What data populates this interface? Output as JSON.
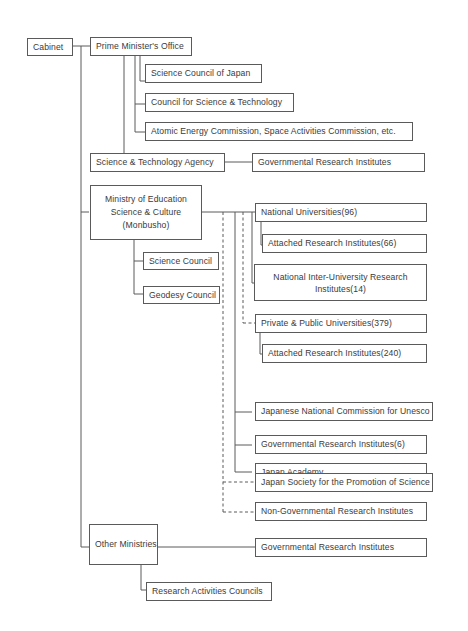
{
  "diagram": {
    "title": "",
    "colors": {
      "line": "#5a5a5a",
      "text": "#3a3a3a",
      "background": "#ffffff"
    },
    "nodes": {
      "cabinet": "Cabinet",
      "prime_ministers_office": "Prime Minister's Office",
      "science_council_of_japan": "Science Council of Japan",
      "council_for_science_technology": "Council for Science & Technology",
      "atomic_energy_commission": "Atomic Energy Commission, Space Activities Commission, etc.",
      "science_technology_agency": "Science & Technology Agency",
      "sta_governmental_research_institutes": "Governmental  Research Institutes",
      "monbusho_line1": "Ministry of Education",
      "monbusho_line2": "Science & Culture",
      "monbusho_line3": "(Monbusho)",
      "science_council": "Science Council",
      "geodesy_council": "Geodesy Council",
      "national_universities": "National  Universities(96)",
      "attached_research_institutes_66": "Attached Research Institutes(66)",
      "national_inter_university_line1": "National Inter-University Research",
      "national_inter_university_line2": "Institutes(14)",
      "private_public_universities": "Private & Public Universities(379)",
      "attached_research_institutes_240": "Attached Research Institutes(240)",
      "unesco_commission": "Japanese National Commission for Unesco",
      "monbusho_governmental_research_institutes": "Governmental Research Institutes(6)",
      "japan_academy": "Japan Academy",
      "jsps": "Japan Society for the Promotion of Science",
      "non_governmental_research_institutes": "Non-Governmental Research Institutes",
      "other_ministries": "Other Ministries",
      "other_governmental_research_institutes": "Governmental Research Institutes",
      "research_activities_councils": "Research Activities Councils"
    },
    "edges": [
      {
        "from": "Cabinet",
        "to": "Prime Minister's Office",
        "style": "solid"
      },
      {
        "from": "Prime Minister's Office",
        "to": "Science Council of Japan",
        "style": "solid"
      },
      {
        "from": "Prime Minister's Office",
        "to": "Council for Science & Technology",
        "style": "solid"
      },
      {
        "from": "Prime Minister's Office",
        "to": "Atomic Energy Commission, Space Activities Commission, etc.",
        "style": "solid"
      },
      {
        "from": "Prime Minister's Office",
        "to": "Science & Technology Agency",
        "style": "solid"
      },
      {
        "from": "Science & Technology Agency",
        "to": "Governmental Research Institutes",
        "style": "solid"
      },
      {
        "from": "Cabinet",
        "to": "Ministry of Education Science & Culture (Monbusho)",
        "style": "solid"
      },
      {
        "from": "Monbusho",
        "to": "Science Council",
        "style": "solid"
      },
      {
        "from": "Monbusho",
        "to": "Geodesy Council",
        "style": "solid"
      },
      {
        "from": "Monbusho",
        "to": "National Universities(96)",
        "style": "solid"
      },
      {
        "from": "National Universities(96)",
        "to": "Attached Research Institutes(66)",
        "style": "solid"
      },
      {
        "from": "Monbusho",
        "to": "National Inter-University Research Institutes(14)",
        "style": "solid"
      },
      {
        "from": "Monbusho",
        "to": "Private & Public Universities(379)",
        "style": "dashed"
      },
      {
        "from": "Private & Public Universities(379)",
        "to": "Attached Research Institutes(240)",
        "style": "solid"
      },
      {
        "from": "Monbusho",
        "to": "Japanese National Commission for Unesco",
        "style": "solid"
      },
      {
        "from": "Monbusho",
        "to": "Governmental Research Institutes(6)",
        "style": "solid"
      },
      {
        "from": "Monbusho",
        "to": "Japan Academy",
        "style": "solid"
      },
      {
        "from": "Monbusho",
        "to": "Japan Society for the Promotion of Science",
        "style": "dashed"
      },
      {
        "from": "Monbusho",
        "to": "Non-Governmental Research Institutes",
        "style": "dashed"
      },
      {
        "from": "Cabinet",
        "to": "Other Ministries",
        "style": "solid"
      },
      {
        "from": "Other Ministries",
        "to": "Governmental Research Institutes",
        "style": "solid"
      },
      {
        "from": "Other Ministries",
        "to": "Research Activities Councils",
        "style": "solid"
      }
    ]
  }
}
